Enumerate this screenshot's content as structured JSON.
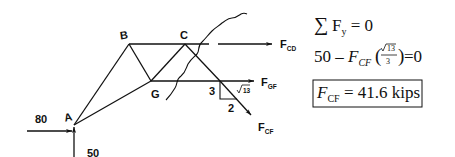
{
  "diagram": {
    "nodes": [
      {
        "id": "A",
        "label": "A"
      },
      {
        "id": "B",
        "label": "B"
      },
      {
        "id": "C",
        "label": "C"
      },
      {
        "id": "G",
        "label": "G"
      }
    ],
    "loads": {
      "horizontal_at_A": "80",
      "vertical_at_A": "50"
    },
    "member_forces": {
      "cd": {
        "main": "F",
        "sub": "CD"
      },
      "gf": {
        "main": "F",
        "sub": "GF"
      },
      "cf": {
        "main": "F",
        "sub": "CF"
      }
    },
    "slope_triangle": {
      "rise": "3",
      "run": "2",
      "hyp": "13"
    }
  },
  "equations": {
    "line1": {
      "sigma": "∑",
      "F": "F",
      "sub": "y",
      "rest": " = 0"
    },
    "line2": {
      "prefix": "50 – ",
      "F": "F",
      "sub": "CF",
      "frac_num": "13",
      "frac_den": "3",
      "rest": "=0"
    },
    "result": {
      "F": "F",
      "sub": "CF",
      "rest": " = 41.6 kips"
    }
  }
}
